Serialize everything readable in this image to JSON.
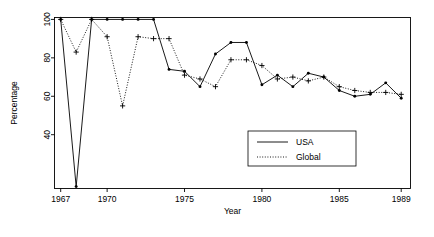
{
  "chart_data": {
    "type": "line",
    "title": "",
    "xlabel": "Year",
    "ylabel": "Percentage",
    "xlim": [
      1966.6,
      1989.6
    ],
    "ylim": [
      12,
      101
    ],
    "grid": false,
    "legend_position": "bottom-right",
    "xticks": [
      1967,
      1970,
      1975,
      1980,
      1985,
      1989
    ],
    "xticklabels": [
      "1967",
      "1970",
      "1975",
      "1980",
      "1985",
      "1989"
    ],
    "yticks": [
      40,
      60,
      80,
      100
    ],
    "yticklabels": [
      "40",
      "60",
      "80",
      "100"
    ],
    "x": [
      1967,
      1968,
      1969,
      1970,
      1971,
      1972,
      1973,
      1974,
      1975,
      1976,
      1977,
      1978,
      1979,
      1980,
      1981,
      1982,
      1983,
      1984,
      1985,
      1986,
      1987,
      1988,
      1989
    ],
    "series": [
      {
        "name": "USA",
        "style": "solid",
        "marker": "dot",
        "values": [
          100,
          13,
          100,
          100,
          100,
          100,
          100,
          74,
          73,
          65,
          82,
          88,
          88,
          66,
          71,
          65,
          72,
          70,
          63,
          60,
          61,
          67,
          59
        ]
      },
      {
        "name": "Global",
        "style": "dotted",
        "marker": "plus",
        "values": [
          100,
          83,
          100,
          91,
          55,
          91,
          90,
          90,
          71,
          69,
          65,
          79,
          79,
          76,
          69,
          70,
          68,
          70,
          65,
          63,
          62,
          62,
          61
        ]
      }
    ]
  },
  "legend": {
    "items": [
      {
        "label": "USA",
        "style": "solid"
      },
      {
        "label": "Global",
        "style": "dotted"
      }
    ]
  },
  "axes": {
    "x_title": "Year",
    "y_title": "Percentage"
  }
}
